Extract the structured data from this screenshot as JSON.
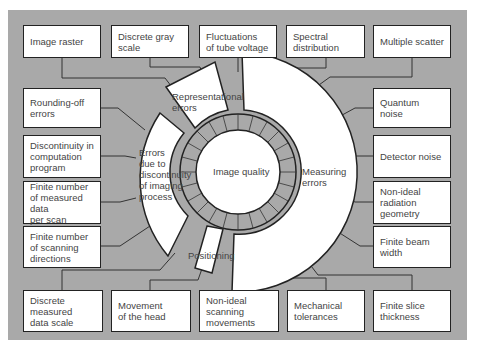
{
  "center": {
    "label": "Image quality"
  },
  "sectors": {
    "representational": "Representational\nerrors",
    "discontinuity": "Errors\ndue to\ndiscontinuity\nof imaging\nprocess",
    "measuring": "Measuring\nerrors",
    "positioning": "Positioning"
  },
  "boxes": {
    "top": [
      "Image raster",
      "Discrete gray\nscale",
      "Fluctuations\nof tube voltage",
      "Spectral\ndistribution",
      "Multiple scatter"
    ],
    "left": [
      "Rounding-off\nerrors",
      "Discontinuity in\ncomputation\nprogram",
      "Finite number\nof measured data\nper scan",
      "Finite number\nof scanning\ndirections"
    ],
    "right": [
      "Quantum noise",
      "Detector noise",
      "Non-ideal\nradiation geometry",
      "Finite beam width"
    ],
    "bottom": [
      "Discrete measured\ndata scale",
      "Movement\nof the head",
      "Non-ideal scanning\nmovements",
      "Mechanical\ntolerances",
      "Finite slice\nthickness"
    ]
  },
  "colors": {
    "panel": "#a9a9a9",
    "box": "#ffffff",
    "line": "#222222",
    "text": "#444444"
  }
}
